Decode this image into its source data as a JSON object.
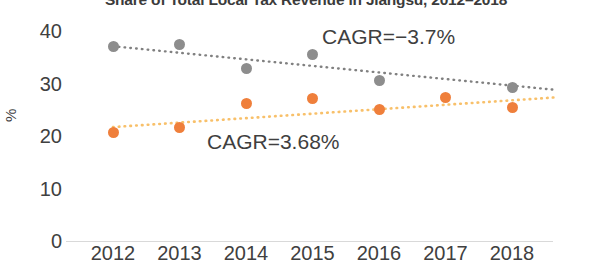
{
  "chart_data": {
    "type": "scatter",
    "title": "Share of Total Local Tax Revenue in Jiangsu, 2012–2018",
    "xlabel": "",
    "ylabel": "%",
    "ylim": [
      0,
      40
    ],
    "yticks": [
      0,
      10,
      20,
      30,
      40
    ],
    "categories": [
      "2012",
      "2013",
      "2014",
      "2015",
      "2016",
      "2017",
      "2018"
    ],
    "grid": false,
    "legend": "none",
    "series": [
      {
        "name": "gray-series",
        "color": "#8d8d8d",
        "values": [
          37.0,
          37.5,
          32.8,
          35.5,
          30.6,
          null,
          29.3
        ],
        "trendline": {
          "style": "dotted",
          "color": "#808080",
          "start": [
            2012,
            37.1
          ],
          "end": [
            2018,
            29.6
          ]
        },
        "annotation": "CAGR=−3.7%"
      },
      {
        "name": "orange-series",
        "color": "#ef7f3b",
        "values": [
          20.7,
          21.6,
          26.1,
          27.1,
          25.0,
          27.3,
          25.5
        ],
        "trendline": {
          "style": "dotted",
          "color": "#f8c06a",
          "start": [
            2012,
            21.7
          ],
          "end": [
            2018,
            26.8
          ]
        },
        "annotation": "CAGR=3.68%"
      }
    ],
    "annotations": [
      {
        "text": "CAGR=−3.7%",
        "series": "gray-series"
      },
      {
        "text": "CAGR=3.68%",
        "series": "orange-series"
      }
    ]
  },
  "axis": {
    "y_ticks": [
      "40",
      "30",
      "20",
      "10",
      "0"
    ],
    "y_title": "%",
    "x_ticks": [
      "2012",
      "2013",
      "2014",
      "2015",
      "2016",
      "2017",
      "2018"
    ]
  },
  "labels": {
    "cagr_gray": "CAGR=−3.7%",
    "cagr_orange": "CAGR=3.68%",
    "title": "Share of Total Local Tax Revenue in Jiangsu, 2012–2018"
  },
  "colors": {
    "gray_marker": "#8d8d8d",
    "orange_marker": "#ef7f3b",
    "gray_trend": "#808080",
    "orange_trend": "#f8c06a",
    "axis_line": "#d9d9d9",
    "text": "#404040"
  }
}
